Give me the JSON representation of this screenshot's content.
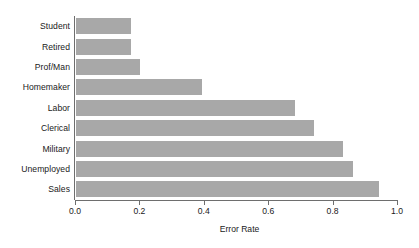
{
  "chart_data": {
    "type": "bar",
    "orientation": "horizontal",
    "title": "",
    "subtitle": "",
    "xlabel": "Error Rate",
    "ylabel": "",
    "categories": [
      "Student",
      "Retired",
      "Prof/Man",
      "Homemaker",
      "Labor",
      "Clerical",
      "Military",
      "Unemployed",
      "Sales"
    ],
    "values": [
      0.17,
      0.17,
      0.2,
      0.39,
      0.68,
      0.74,
      0.83,
      0.86,
      0.94
    ],
    "xlim": [
      0.0,
      1.0
    ],
    "xticks": [
      0.0,
      0.2,
      0.4,
      0.6,
      0.8,
      1.0
    ],
    "xtick_labels": [
      "0.0",
      "0.2",
      "0.4",
      "0.6",
      "0.8",
      "1.0"
    ],
    "grid": false,
    "legend": null,
    "bar_color": "#a8a8a8",
    "axis_color": "#6e6e6e",
    "background": "#ffffff"
  }
}
